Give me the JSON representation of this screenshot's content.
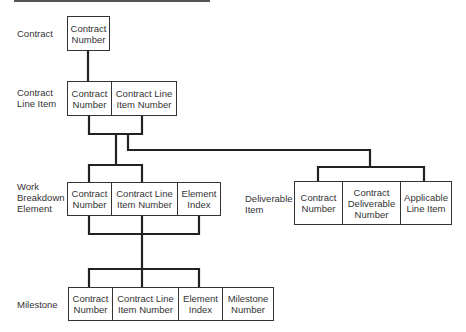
{
  "diagram": {
    "records": [
      {
        "id": "contract",
        "label": "Contract",
        "fields": [
          "Contract\nNumber"
        ]
      },
      {
        "id": "contract-line-item",
        "label": "Contract\nLine Item",
        "fields": [
          "Contract\nNumber",
          "Contract Line\nItem Number"
        ]
      },
      {
        "id": "work-breakdown-element",
        "label": "Work\nBreakdown\nElement",
        "fields": [
          "Contract\nNumber",
          "Contract Line\nItem Number",
          "Element\nIndex"
        ]
      },
      {
        "id": "deliverable-item",
        "label": "Deliverable\nItem",
        "fields": [
          "Contract\nNumber",
          "Contract\nDeliverable\nNumber",
          "Applicable\nLine Item"
        ]
      },
      {
        "id": "milestone",
        "label": "Milestone",
        "fields": [
          "Contract\nNumber",
          "Contract Line\nItem Number",
          "Element\nIndex",
          "Milestone\nNumber"
        ]
      }
    ],
    "relationships": [
      {
        "from": "contract",
        "to": "contract-line-item"
      },
      {
        "from": "contract-line-item",
        "to": "work-breakdown-element"
      },
      {
        "from": "contract-line-item",
        "to": "deliverable-item"
      },
      {
        "from": "work-breakdown-element",
        "to": "milestone"
      }
    ]
  }
}
